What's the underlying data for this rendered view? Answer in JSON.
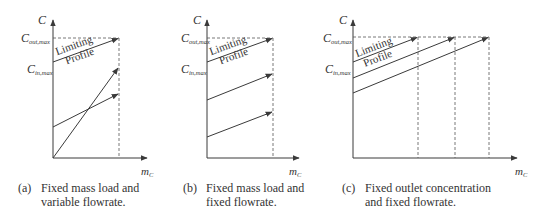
{
  "figure": {
    "colors": {
      "line": "#3a3a3a",
      "dashed": "#555555",
      "text": "#333333"
    },
    "panels": [
      {
        "id": "a",
        "y_axis_label": "C",
        "x_axis_label_main": "m",
        "x_axis_label_sub": "C",
        "c_out_label_main": "C",
        "c_out_label_sub": "out,max",
        "c_in_label_main": "C",
        "c_in_label_sub": "in,max",
        "limiting_text_1": "Limiting",
        "limiting_text_2": "Profile",
        "caption_tag": "(a)",
        "caption_line_1": "Fixed mass load and",
        "caption_line_2": "variable flowrate."
      },
      {
        "id": "b",
        "y_axis_label": "C",
        "x_axis_label_main": "m",
        "x_axis_label_sub": "C",
        "c_out_label_main": "C",
        "c_out_label_sub": "out,max",
        "c_in_label_main": "C",
        "c_in_label_sub": "in,max",
        "limiting_text_1": "Limiting",
        "limiting_text_2": "Profile",
        "caption_tag": "(b)",
        "caption_line_1": "Fixed mass load and",
        "caption_line_2": "fixed flowrate."
      },
      {
        "id": "c",
        "y_axis_label": "C",
        "x_axis_label_main": "m",
        "x_axis_label_sub": "C",
        "c_out_label_main": "C",
        "c_out_label_sub": "out,max",
        "c_in_label_main": "C",
        "c_in_label_sub": "in,max",
        "limiting_text_1": "Limiting",
        "limiting_text_2": "Profile",
        "caption_tag": "(c)",
        "caption_line_1": "Fixed outlet concentration",
        "caption_line_2": "and fixed flowrate."
      }
    ]
  }
}
